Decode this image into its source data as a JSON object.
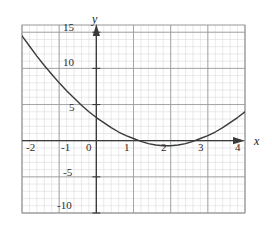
{
  "figure": {
    "background_color": "#ffffff",
    "curve_color": "#3a3a3a",
    "axis_color": "#3a3a3a",
    "major_grid_color": "#9a9a9a",
    "minor_grid_color": "#cfcfcf",
    "label_color": "#2b2b2b"
  },
  "axis_names": {
    "x": "x",
    "y": "y"
  },
  "chart_data": {
    "type": "line",
    "title": "",
    "subtitle": "",
    "xlabel": "x",
    "ylabel": "y",
    "xlim": [
      -2,
      4
    ],
    "ylim": [
      -10,
      16
    ],
    "grid": true,
    "minor_grid": true,
    "legend": "none",
    "x_ticks": [
      -2,
      -1,
      0,
      1,
      2,
      3,
      4
    ],
    "x_tick_labels": [
      "-2",
      "-1",
      "0",
      "1",
      "2",
      "3",
      "4"
    ],
    "y_ticks": [
      -10,
      -5,
      0,
      5,
      10,
      15
    ],
    "y_tick_labels": [
      "-10",
      "-5",
      "0",
      "5",
      "10",
      "15"
    ],
    "major_grid_step_x": 1,
    "major_grid_step_y": 5,
    "minor_grid_step_x": 0.2,
    "minor_grid_step_y": 1,
    "series": [
      {
        "name": "curve",
        "type": "parabola",
        "x": [
          -2.0,
          -1.8,
          -1.6,
          -1.4,
          -1.2,
          -1.0,
          -0.8,
          -0.6,
          -0.4,
          -0.2,
          0.0,
          0.2,
          0.4,
          0.6,
          0.8,
          1.0,
          1.2,
          1.4,
          1.6,
          1.8,
          2.0,
          2.2,
          2.4,
          2.6,
          2.8,
          3.0,
          3.2,
          3.4,
          3.6,
          3.8,
          4.0
        ],
        "y": [
          14.5,
          13.1,
          11.7,
          10.4,
          9.2,
          8.0,
          6.9,
          5.9,
          4.9,
          4.0,
          3.2,
          2.5,
          1.8,
          1.2,
          0.7,
          0.3,
          -0.1,
          -0.4,
          -0.6,
          -0.7,
          -0.7,
          -0.6,
          -0.4,
          -0.1,
          0.3,
          0.7,
          1.2,
          1.8,
          2.5,
          3.2,
          4.0
        ],
        "y_intercept": 3.2,
        "vertex": [
          1.9,
          -0.72
        ],
        "roots": [
          1.13,
          2.77
        ]
      }
    ]
  }
}
